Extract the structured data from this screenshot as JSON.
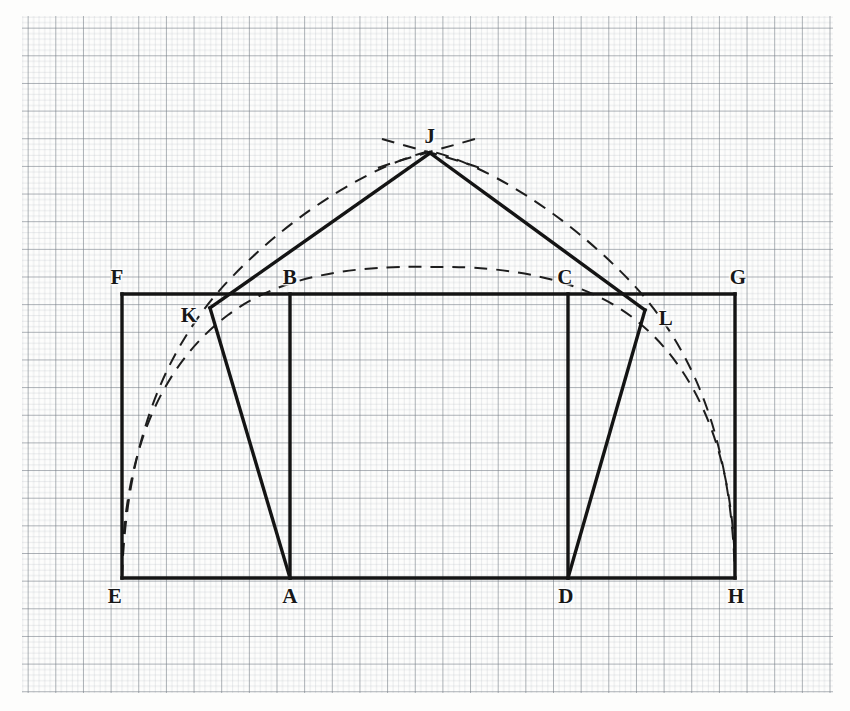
{
  "page": {
    "background_color": "#fdfdfc",
    "width": 850,
    "height": 711
  },
  "grid": {
    "name": "graph-paper-grid",
    "origin_x": 22,
    "origin_y": 16,
    "right": 833,
    "bottom": 693,
    "minor_spacing_px": 5.53,
    "major_spacing_px": 27.65,
    "minor_color": "#9aa3ae",
    "major_color": "#5d6670",
    "minor_width": 0.5,
    "major_width": 1.0
  },
  "style": {
    "solid_color": "#141414",
    "solid_width": 3.4,
    "dashed_color": "#1d1d1d",
    "dashed_width": 2.0,
    "dash_pattern": "13 9"
  },
  "points": {
    "A": {
      "label": "A",
      "x": 290,
      "y": 578,
      "label_x": 290,
      "label_y": 596
    },
    "B": {
      "label": "B",
      "x": 290,
      "y": 294,
      "label_x": 290,
      "label_y": 277
    },
    "C": {
      "label": "C",
      "x": 568,
      "y": 294,
      "label_x": 565,
      "label_y": 277
    },
    "D": {
      "label": "D",
      "x": 568,
      "y": 578,
      "label_x": 566,
      "label_y": 596
    },
    "E": {
      "label": "E",
      "x": 122,
      "y": 578,
      "label_x": 115,
      "label_y": 596
    },
    "F": {
      "label": "F",
      "x": 122,
      "y": 294,
      "label_x": 117,
      "label_y": 277
    },
    "G": {
      "label": "G",
      "x": 735,
      "y": 294,
      "label_x": 738,
      "label_y": 277
    },
    "H": {
      "label": "H",
      "x": 735,
      "y": 578,
      "label_x": 736,
      "label_y": 596
    },
    "J": {
      "label": "J",
      "x": 430,
      "y": 153,
      "label_x": 430,
      "label_y": 136
    },
    "K": {
      "label": "K",
      "x": 210,
      "y": 308,
      "label_x": 189,
      "label_y": 315
    },
    "L": {
      "label": "L",
      "x": 645,
      "y": 310,
      "label_x": 666,
      "label_y": 318
    }
  },
  "solid_segments": [
    {
      "name": "segment-EF",
      "from": "E",
      "to": "F"
    },
    {
      "name": "segment-FG",
      "from": "F",
      "to": "G"
    },
    {
      "name": "segment-GH",
      "from": "G",
      "to": "H"
    },
    {
      "name": "segment-EH",
      "from": "E",
      "to": "H"
    },
    {
      "name": "segment-BA",
      "from": "B",
      "to": "A"
    },
    {
      "name": "segment-CD",
      "from": "C",
      "to": "D"
    },
    {
      "name": "segment-KJ",
      "from": "K",
      "to": "J"
    },
    {
      "name": "segment-JL",
      "from": "J",
      "to": "L"
    },
    {
      "name": "segment-KA",
      "from": "K",
      "to": "A"
    },
    {
      "name": "segment-LD",
      "from": "L",
      "to": "D"
    }
  ],
  "dashed_arcs": [
    {
      "name": "outer-construction-arc-EJH",
      "description": "Large dashed arc from E through apex J to H",
      "path": "M 122 578 C 126 452 160 352 230 279 C 300 206 380 163 430 151 C 480 163 560 208 630 281 C 700 354 732 453 735 578"
    },
    {
      "name": "inner-construction-arc-EH",
      "description": "Flatter dashed arc from E through peak near 268 to H",
      "path": "M 122 578 C 122 470 152 372 228 315 C 290 268 380 266 430 267 C 480 266 570 270 632 317 C 706 374 735 471 735 578"
    },
    {
      "name": "apex-cross-arc-left",
      "description": "Short dashed intersection arc crossing at apex J, rising left to right",
      "path": "M 378 168 C 398 160 452 146 478 138"
    },
    {
      "name": "apex-cross-arc-right",
      "description": "Short dashed intersection arc crossing at apex J, falling left to right",
      "path": "M 382 139 C 402 145 456 159 480 168"
    }
  ]
}
